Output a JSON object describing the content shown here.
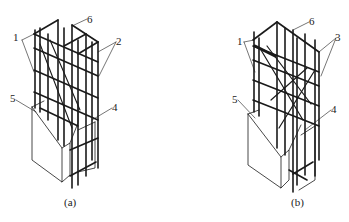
{
  "figure": {
    "type": "engineering-diagram",
    "stroke_color": "#1a1a1a",
    "background": "#ffffff"
  },
  "panels": [
    {
      "id": "a",
      "caption": "(a)",
      "callouts": [
        {
          "num": "1",
          "x": 16,
          "y": 36
        },
        {
          "num": "2",
          "x": 117,
          "y": 38
        },
        {
          "num": "4",
          "x": 113,
          "y": 104
        },
        {
          "num": "5",
          "x": 10,
          "y": 97
        },
        {
          "num": "6",
          "x": 88,
          "y": 15
        }
      ]
    },
    {
      "id": "b",
      "caption": "(b)",
      "callouts": [
        {
          "num": "1",
          "x": 65,
          "y": 38
        },
        {
          "num": "3",
          "x": 162,
          "y": 34
        },
        {
          "num": "4",
          "x": 157,
          "y": 106
        },
        {
          "num": "5",
          "x": 58,
          "y": 97
        },
        {
          "num": "6",
          "x": 135,
          "y": 18
        }
      ]
    }
  ]
}
